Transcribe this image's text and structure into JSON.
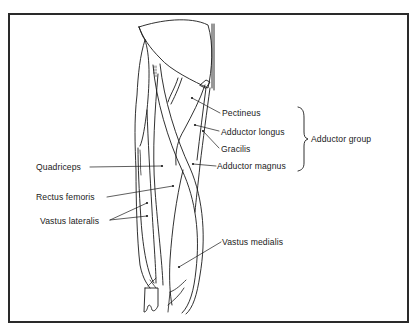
{
  "diagram": {
    "frame": {
      "x": 8,
      "y": 13,
      "width": 401,
      "height": 310,
      "border_color": "#2a2a2a"
    },
    "ink_color": "#1a1a1a",
    "labels": [
      {
        "id": "pectineus",
        "text": "Pectineus",
        "x": 222,
        "y": 108,
        "anchor": [
          192,
          98
        ],
        "line_from": [
          220,
          113
        ]
      },
      {
        "id": "adductor-longus",
        "text": "Adductor longus",
        "x": 221,
        "y": 127,
        "anchor": [
          195,
          125
        ],
        "line_from": [
          219,
          131
        ]
      },
      {
        "id": "gracilis",
        "text": "Gracilis",
        "x": 221,
        "y": 144,
        "anchor": [
          203,
          131
        ],
        "line_from": [
          219,
          148
        ]
      },
      {
        "id": "adductor-magnus",
        "text": "Adductor magnus",
        "x": 217,
        "y": 161,
        "anchor": [
          193,
          164
        ],
        "line_from": [
          216,
          166
        ]
      },
      {
        "id": "quadriceps",
        "text": "Quadriceps",
        "x": 36,
        "y": 162,
        "anchor": [
          162,
          166
        ],
        "line_from": [
          90,
          167
        ]
      },
      {
        "id": "rectus-femoris",
        "text": "Rectus femoris",
        "x": 36,
        "y": 192,
        "anchor": [
          173,
          186
        ],
        "line_from": [
          107,
          197
        ]
      },
      {
        "id": "vastus-lateralis",
        "text": "Vastus lateralis",
        "x": 40,
        "y": 216,
        "anchor": [
          147,
          203
        ],
        "anchor2": [
          147,
          216
        ],
        "line_from": [
          110,
          220
        ]
      },
      {
        "id": "vastus-medialis",
        "text": "Vastus medialis",
        "x": 222,
        "y": 237,
        "anchor": [
          179,
          267
        ],
        "line_from": [
          221,
          242
        ]
      }
    ],
    "group": {
      "id": "adductor-group",
      "text": "Adductor group",
      "x": 311,
      "y": 134,
      "brace": {
        "x": 302,
        "top": 107,
        "bottom": 171
      }
    }
  }
}
